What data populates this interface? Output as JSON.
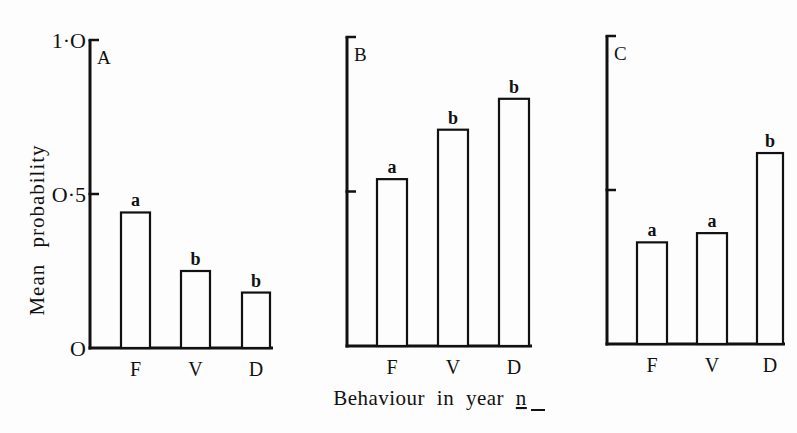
{
  "chart_data": [
    {
      "type": "bar",
      "panel": "A",
      "categories": [
        "F",
        "V",
        "D"
      ],
      "values": [
        0.44,
        0.25,
        0.18
      ],
      "significance_letters": [
        "a",
        "b",
        "b"
      ],
      "ylim": [
        0,
        1.0
      ],
      "yticks": [
        0,
        0.5,
        1.0
      ],
      "ytick_labels": [
        "O",
        "O·5",
        "1·O"
      ],
      "ylabel": "Mean probability",
      "grid": false
    },
    {
      "type": "bar",
      "panel": "B",
      "categories": [
        "F",
        "V",
        "D"
      ],
      "values": [
        0.54,
        0.7,
        0.8
      ],
      "significance_letters": [
        "a",
        "b",
        "b"
      ],
      "ylim": [
        0,
        1.0
      ],
      "yticks": [
        0,
        0.5,
        1.0
      ],
      "grid": false
    },
    {
      "type": "bar",
      "panel": "C",
      "categories": [
        "F",
        "V",
        "D"
      ],
      "values": [
        0.33,
        0.36,
        0.62
      ],
      "significance_letters": [
        "a",
        "a",
        "b"
      ],
      "ylim": [
        0,
        1.0
      ],
      "yticks": [
        0,
        0.5,
        1.0
      ],
      "grid": false
    }
  ],
  "shared": {
    "xlabel_main": "Behaviour in year ",
    "xlabel_var": "n",
    "ylabel": "Mean probability",
    "ytick_labels": {
      "zero": "O",
      "half": "O·5",
      "one": "1·O"
    }
  }
}
